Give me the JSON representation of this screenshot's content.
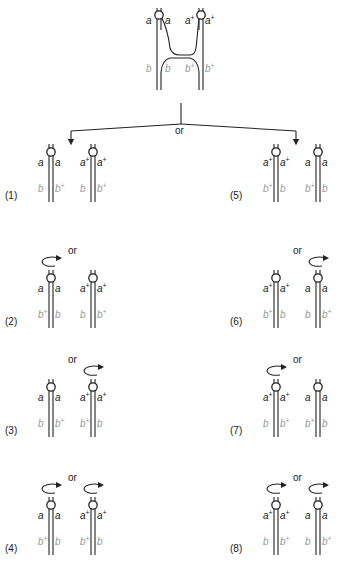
{
  "top": {
    "labels": {
      "left_outer_a": "a",
      "left_inner_a": "a",
      "right_inner_a": "a",
      "right_inner_a_sup": "+",
      "right_outer_a": "a",
      "right_outer_a_sup": "+",
      "left_outer_b": "b",
      "left_inner_b": "b",
      "right_inner_b": "b",
      "right_inner_b_sup": "+",
      "right_outer_b": "b",
      "right_outer_b_sup": "+"
    }
  },
  "branch": {
    "or_label": "or"
  },
  "panels": [
    {
      "id": "1",
      "label": "(1)",
      "pairs": [
        {
          "a_left": "a",
          "a_left_sup": "",
          "a_right": "a",
          "a_right_sup": "",
          "b_left": "b",
          "b_left_sup": "",
          "b_right": "b",
          "b_right_sup": "+",
          "rotation": false
        },
        {
          "a_left": "a",
          "a_left_sup": "+",
          "a_right": "a",
          "a_right_sup": "+",
          "b_left": "b",
          "b_left_sup": "",
          "b_right": "b",
          "b_right_sup": "+",
          "rotation": false
        }
      ],
      "or_label": ""
    },
    {
      "id": "2",
      "label": "(2)",
      "pairs": [
        {
          "a_left": "a",
          "a_left_sup": "",
          "a_right": "a",
          "a_right_sup": "",
          "b_left": "b",
          "b_left_sup": "+",
          "b_right": "b",
          "b_right_sup": "",
          "rotation": true
        },
        {
          "a_left": "a",
          "a_left_sup": "+",
          "a_right": "a",
          "a_right_sup": "+",
          "b_left": "b",
          "b_left_sup": "",
          "b_right": "b",
          "b_right_sup": "+",
          "rotation": false
        }
      ],
      "or_label": "or"
    },
    {
      "id": "3",
      "label": "(3)",
      "pairs": [
        {
          "a_left": "a",
          "a_left_sup": "",
          "a_right": "a",
          "a_right_sup": "",
          "b_left": "b",
          "b_left_sup": "",
          "b_right": "b",
          "b_right_sup": "+",
          "rotation": false
        },
        {
          "a_left": "a",
          "a_left_sup": "+",
          "a_right": "a",
          "a_right_sup": "+",
          "b_left": "b",
          "b_left_sup": "+",
          "b_right": "b",
          "b_right_sup": "",
          "rotation": true
        }
      ],
      "or_label": "or"
    },
    {
      "id": "4",
      "label": "(4)",
      "pairs": [
        {
          "a_left": "a",
          "a_left_sup": "",
          "a_right": "a",
          "a_right_sup": "",
          "b_left": "b",
          "b_left_sup": "+",
          "b_right": "b",
          "b_right_sup": "",
          "rotation": true
        },
        {
          "a_left": "a",
          "a_left_sup": "+",
          "a_right": "a",
          "a_right_sup": "+",
          "b_left": "b",
          "b_left_sup": "+",
          "b_right": "b",
          "b_right_sup": "",
          "rotation": true
        }
      ],
      "or_label": "or"
    },
    {
      "id": "5",
      "label": "(5)",
      "pairs": [
        {
          "a_left": "a",
          "a_left_sup": "+",
          "a_right": "a",
          "a_right_sup": "+",
          "b_left": "b",
          "b_left_sup": "+",
          "b_right": "b",
          "b_right_sup": "",
          "rotation": false
        },
        {
          "a_left": "a",
          "a_left_sup": "",
          "a_right": "a",
          "a_right_sup": "",
          "b_left": "b",
          "b_left_sup": "+",
          "b_right": "b",
          "b_right_sup": "",
          "rotation": false
        }
      ],
      "or_label": ""
    },
    {
      "id": "6",
      "label": "(6)",
      "pairs": [
        {
          "a_left": "a",
          "a_left_sup": "+",
          "a_right": "a",
          "a_right_sup": "+",
          "b_left": "b",
          "b_left_sup": "+",
          "b_right": "b",
          "b_right_sup": "",
          "rotation": false
        },
        {
          "a_left": "a",
          "a_left_sup": "",
          "a_right": "a",
          "a_right_sup": "",
          "b_left": "b",
          "b_left_sup": "",
          "b_right": "b",
          "b_right_sup": "+",
          "rotation": true
        }
      ],
      "or_label": "or"
    },
    {
      "id": "7",
      "label": "(7)",
      "pairs": [
        {
          "a_left": "a",
          "a_left_sup": "+",
          "a_right": "a",
          "a_right_sup": "+",
          "b_left": "b",
          "b_left_sup": "",
          "b_right": "b",
          "b_right_sup": "+",
          "rotation": true
        },
        {
          "a_left": "a",
          "a_left_sup": "",
          "a_right": "a",
          "a_right_sup": "",
          "b_left": "b",
          "b_left_sup": "+",
          "b_right": "b",
          "b_right_sup": "",
          "rotation": false
        }
      ],
      "or_label": "or"
    },
    {
      "id": "8",
      "label": "(8)",
      "pairs": [
        {
          "a_left": "a",
          "a_left_sup": "+",
          "a_right": "a",
          "a_right_sup": "+",
          "b_left": "b",
          "b_left_sup": "",
          "b_right": "b",
          "b_right_sup": "+",
          "rotation": true
        },
        {
          "a_left": "a",
          "a_left_sup": "",
          "a_right": "a",
          "a_right_sup": "",
          "b_left": "b",
          "b_left_sup": "",
          "b_right": "b",
          "b_right_sup": "+",
          "rotation": true
        }
      ],
      "or_label": "or"
    }
  ],
  "colors": {
    "strand": "#222222",
    "a_label": "#222222",
    "b_label": "#999999"
  }
}
